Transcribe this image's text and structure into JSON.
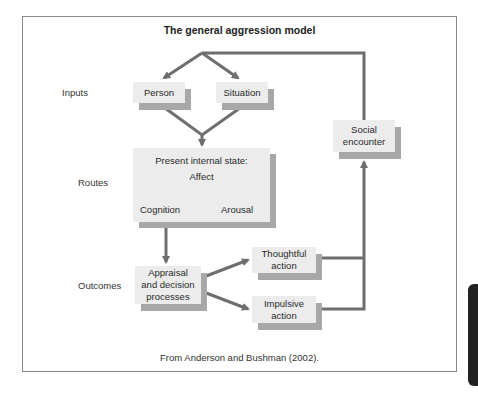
{
  "figure": {
    "title": "The general aggression model",
    "caption": "From Anderson and Bushman (2002).",
    "colors": {
      "box_fill": "#ececec",
      "box_shadow": "#a8a8a8",
      "arrow": "#6e6e6e",
      "frame": "#8a8a8a",
      "side_tab": "#222222"
    }
  },
  "row_labels": {
    "inputs": "Inputs",
    "routes": "Routes",
    "outcomes": "Outcomes"
  },
  "nodes": {
    "person": "Person",
    "situation": "Situation",
    "internal_state": {
      "heading": "Present internal state:",
      "affect": "Affect",
      "cognition": "Cognition",
      "arousal": "Arousal"
    },
    "appraisal": "Appraisal\nand decision\nprocesses",
    "thoughtful": "Thoughtful\naction",
    "impulsive": "Impulsive\naction",
    "social": "Social\nencounter"
  },
  "edges": [
    {
      "from": "social",
      "to": "person"
    },
    {
      "from": "social",
      "to": "situation"
    },
    {
      "from": "person",
      "to": "internal_state"
    },
    {
      "from": "situation",
      "to": "internal_state"
    },
    {
      "from": "internal_state",
      "to": "appraisal"
    },
    {
      "from": "appraisal",
      "to": "thoughtful"
    },
    {
      "from": "appraisal",
      "to": "impulsive"
    },
    {
      "from": "thoughtful",
      "to": "social"
    },
    {
      "from": "impulsive",
      "to": "social"
    }
  ]
}
